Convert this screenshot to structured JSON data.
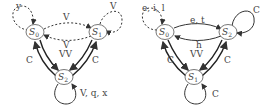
{
  "diagrams": [
    {
      "name": "left",
      "nodes": [
        {
          "id": "S0",
          "label": "S",
          "sub": "0"
        },
        {
          "id": "S1",
          "label": "S",
          "sub": "1"
        },
        {
          "id": "S2",
          "label": "S",
          "sub": "2"
        }
      ],
      "labels": {
        "self_s0": "y",
        "self_s1": "V",
        "s0_s1_top": "V",
        "mid_top": "V",
        "mid_bottom": "VV",
        "left_c": "C",
        "right_c": "C",
        "self_s2": "V, q, x"
      }
    },
    {
      "name": "right",
      "nodes": [
        {
          "id": "S0",
          "label": "S",
          "sub": "0"
        },
        {
          "id": "S2",
          "label": "S",
          "sub": "2"
        },
        {
          "id": "S1",
          "label": "S",
          "sub": "1"
        }
      ],
      "labels": {
        "self_s0": "e, i, l",
        "s0_s2_top": "e, t",
        "self_s2": "C",
        "mid_top": "h",
        "mid_bottom": "VV",
        "left_c": "C",
        "right_c": "C",
        "self_s1": "C"
      }
    }
  ]
}
